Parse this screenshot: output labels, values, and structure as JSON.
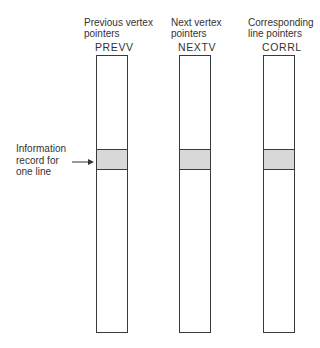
{
  "columns": [
    {
      "header_line1": "Previous vertex",
      "header_line2": "pointers",
      "code": "PREVV"
    },
    {
      "header_line1": "Next vertex",
      "header_line2": "pointers",
      "code": "NEXTV"
    },
    {
      "header_line1": "Corresponding",
      "header_line2": "line pointers",
      "code": "CORRL"
    }
  ],
  "annotation": {
    "line1": "Information",
    "line2": "record for",
    "line3": "one line"
  },
  "colors": {
    "stroke": "#3a3a3a",
    "shaded_band": "#d8d8d8"
  }
}
